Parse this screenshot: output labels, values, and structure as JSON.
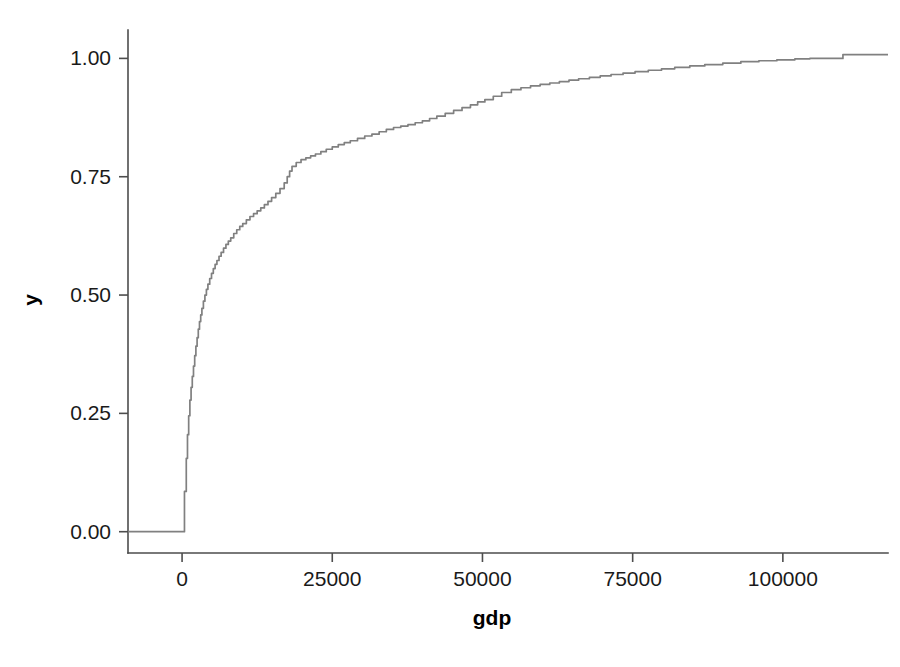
{
  "chart_data": {
    "type": "line",
    "title": "",
    "subtitle": "",
    "xlabel": "gdp",
    "ylabel": "y",
    "xlim": [
      -9000,
      117500
    ],
    "ylim": [
      -0.045,
      1.06
    ],
    "grid": false,
    "legend": null,
    "style": {
      "line_color": "#808080",
      "axis_color": "#4d4d4d",
      "text_color": "#1a1a1a",
      "background": "#ffffff"
    },
    "xticks": [
      0,
      25000,
      50000,
      75000,
      100000
    ],
    "xtick_labels": [
      "0",
      "25000",
      "50000",
      "75000",
      "100000"
    ],
    "yticks": [
      0.0,
      0.25,
      0.5,
      0.75,
      1.0
    ],
    "ytick_labels": [
      "0.00",
      "0.25",
      "0.50",
      "0.75",
      "1.00"
    ],
    "series": [
      {
        "name": "ecdf",
        "step": true,
        "x": [
          -9000,
          0,
          400,
          700,
          900,
          1100,
          1300,
          1500,
          1700,
          1900,
          2100,
          2300,
          2500,
          2700,
          2900,
          3100,
          3300,
          3550,
          3800,
          4050,
          4300,
          4600,
          4900,
          5200,
          5500,
          5800,
          6150,
          6500,
          6900,
          7300,
          7700,
          8100,
          8600,
          9100,
          9600,
          10100,
          10700,
          11300,
          11900,
          12500,
          13100,
          13700,
          14300,
          14900,
          15600,
          16300,
          17000,
          17500,
          17900,
          18300,
          19000,
          19800,
          20600,
          21400,
          22200,
          23100,
          24000,
          25000,
          26000,
          27000,
          28000,
          29200,
          30400,
          31600,
          32800,
          34000,
          35200,
          36400,
          37600,
          38800,
          40000,
          41200,
          42400,
          43800,
          45200,
          46600,
          48000,
          49200,
          50400,
          51800,
          53200,
          54800,
          56400,
          58000,
          59600,
          61200,
          62800,
          64400,
          66000,
          67800,
          69600,
          71400,
          73400,
          75400,
          77600,
          79800,
          82000,
          84500,
          87000,
          90000,
          93000,
          96000,
          99000,
          102000,
          104500,
          105000,
          110000,
          117500
        ],
        "y": [
          0.0,
          0.0,
          0.085,
          0.155,
          0.205,
          0.245,
          0.278,
          0.305,
          0.328,
          0.35,
          0.372,
          0.392,
          0.41,
          0.428,
          0.444,
          0.458,
          0.472,
          0.487,
          0.5,
          0.512,
          0.523,
          0.535,
          0.546,
          0.556,
          0.565,
          0.573,
          0.582,
          0.59,
          0.599,
          0.607,
          0.614,
          0.621,
          0.63,
          0.638,
          0.645,
          0.651,
          0.659,
          0.666,
          0.672,
          0.678,
          0.684,
          0.691,
          0.698,
          0.706,
          0.715,
          0.725,
          0.737,
          0.75,
          0.762,
          0.772,
          0.78,
          0.786,
          0.79,
          0.794,
          0.798,
          0.803,
          0.808,
          0.813,
          0.818,
          0.822,
          0.826,
          0.831,
          0.836,
          0.84,
          0.845,
          0.85,
          0.854,
          0.857,
          0.86,
          0.864,
          0.868,
          0.873,
          0.878,
          0.884,
          0.89,
          0.896,
          0.902,
          0.908,
          0.913,
          0.92,
          0.928,
          0.934,
          0.938,
          0.942,
          0.945,
          0.948,
          0.951,
          0.954,
          0.957,
          0.96,
          0.963,
          0.966,
          0.969,
          0.972,
          0.975,
          0.978,
          0.981,
          0.984,
          0.987,
          0.99,
          0.993,
          0.995,
          0.997,
          0.999,
          1.0,
          1.0,
          1.008,
          1.008
        ]
      }
    ]
  },
  "axes": {
    "x_title": "gdp",
    "y_title": "y"
  }
}
